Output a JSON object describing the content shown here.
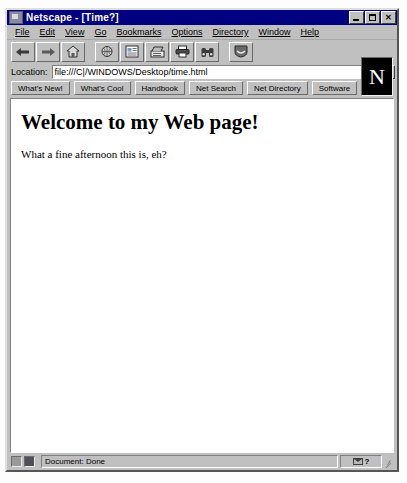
{
  "window": {
    "title": "Netscape - [Time?]",
    "app_icon": "netscape-document-icon",
    "controls": {
      "minimize": "_",
      "maximize": "□",
      "close": "✕"
    }
  },
  "menubar": {
    "items": [
      {
        "label": "File",
        "accel": "F"
      },
      {
        "label": "Edit",
        "accel": "E"
      },
      {
        "label": "View",
        "accel": "V"
      },
      {
        "label": "Go",
        "accel": "G"
      },
      {
        "label": "Bookmarks",
        "accel": "B"
      },
      {
        "label": "Options",
        "accel": "O"
      },
      {
        "label": "Directory",
        "accel": "D"
      },
      {
        "label": "Window",
        "accel": "W"
      },
      {
        "label": "Help",
        "accel": "H"
      }
    ]
  },
  "toolbar": {
    "buttons": [
      {
        "name": "back-button",
        "icon": "left-arrow-icon",
        "label": "Back"
      },
      {
        "name": "forward-button",
        "icon": "right-arrow-icon",
        "label": "Forward"
      },
      {
        "name": "home-button",
        "icon": "house-icon",
        "label": "Home"
      },
      {
        "name": "reload-button",
        "icon": "reload-globe-icon",
        "label": "Reload"
      },
      {
        "name": "images-button",
        "icon": "images-icon",
        "label": "Images"
      },
      {
        "name": "open-button",
        "icon": "open-page-icon",
        "label": "Open"
      },
      {
        "name": "print-button",
        "icon": "printer-icon",
        "label": "Print"
      },
      {
        "name": "find-button",
        "icon": "binoculars-icon",
        "label": "Find"
      },
      {
        "name": "stop-button",
        "icon": "stop-sign-icon",
        "label": "Stop"
      }
    ]
  },
  "location": {
    "label": "Location:",
    "value": "file:///C|/WINDOWS/Desktop/time.html",
    "placeholder": "",
    "dropdown_icon": "chevron-down-icon"
  },
  "directory_bar": {
    "buttons": [
      "What's New!",
      "What's Cool",
      "Handbook",
      "Net Search",
      "Net Directory",
      "Software"
    ]
  },
  "logo": {
    "letter": "N",
    "name": "netscape-logo"
  },
  "content": {
    "heading": "Welcome to my Web page!",
    "paragraph": "What a fine afternoon this is, eh?"
  },
  "statusbar": {
    "security_icon": "broken-key-icon",
    "lock_icon": "unlocked-padlock-icon",
    "message": "Document: Done",
    "mail_icon": "mail-envelope-icon",
    "help_glyph": "?",
    "resize_grip": "resize-grip"
  },
  "colors": {
    "titlebar": "#000080",
    "chrome": "#c0c0c0",
    "content_bg": "#ffffff",
    "text": "#000000",
    "logo_bg": "#000000"
  }
}
